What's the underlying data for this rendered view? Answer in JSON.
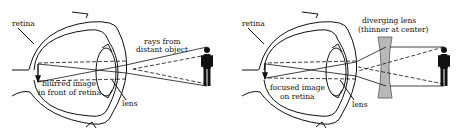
{
  "diagram": {
    "panels": [
      {
        "id": "myopic-eye",
        "labels": {
          "retina": "retina",
          "rays_line1": "rays from",
          "rays_line2": "distant object",
          "image_line1": "blurred image",
          "image_line2": "in front of retina",
          "lens": "lens"
        }
      },
      {
        "id": "corrected-eye",
        "labels": {
          "retina": "retina",
          "corrective_line1": "diverging lens",
          "corrective_line2": "(thinner at center)",
          "image_line1": "focused image",
          "image_line2": "on retina",
          "lens": "lens"
        }
      }
    ],
    "colors": {
      "ink": "#111111",
      "diverging_lens_fill": "#b8b8b8",
      "background": "#ffffff"
    }
  }
}
